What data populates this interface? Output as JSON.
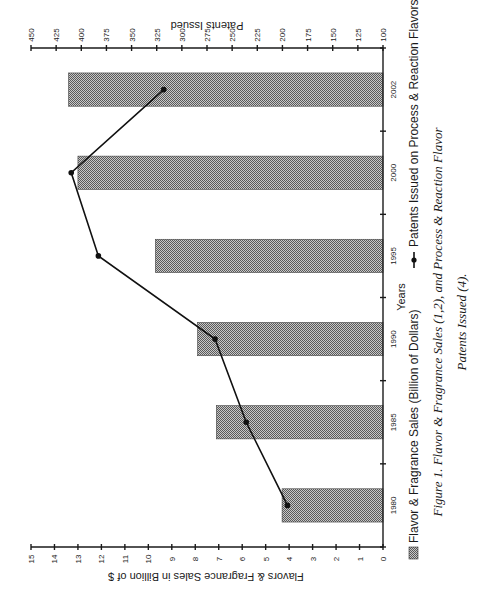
{
  "chart_data": {
    "type": "bar",
    "orientation": "rotated-90-ccw",
    "title": "",
    "caption_line1": "Figure 1. Flavor & Fragrance Sales (1,2), and Process & Reaction Flavor",
    "caption_line2": "Patents Issued (4).",
    "xlabel": "Years",
    "ylabel": "Flavors & Fragrance Sales in Billion of $",
    "y2label": "Patents Issued",
    "categories": [
      "1980",
      "1985",
      "1990",
      "1995",
      "2000",
      "2002"
    ],
    "ylim": [
      0,
      15
    ],
    "y2lim": [
      100,
      450
    ],
    "yticks": [
      0,
      1,
      2,
      3,
      4,
      5,
      6,
      7,
      8,
      9,
      10,
      11,
      12,
      13,
      14,
      15
    ],
    "y2ticks": [
      100,
      125,
      150,
      175,
      200,
      225,
      250,
      275,
      300,
      325,
      350,
      375,
      400,
      425,
      450
    ],
    "grid": false,
    "legend_position": "bottom",
    "series": [
      {
        "name": "Flavor & Fragrance Sales (Billion of Dollars)",
        "type": "bar",
        "axis": "left",
        "values": [
          4.3,
          7.1,
          7.9,
          9.7,
          13.0,
          13.4
        ]
      },
      {
        "name": "Patents Issued on Process & Reaction Flavors",
        "type": "line",
        "axis": "right",
        "values": [
          195,
          236,
          267,
          383,
          410,
          318
        ]
      }
    ]
  },
  "legend": {
    "bar_label": "Flavor & Fragrance Sales (Billion of Dollars)",
    "line_label": "Patents Issued on Process & Reaction Flavors"
  },
  "colors": {
    "bar_dark": "#5a5a5a",
    "bar_light": "#c8c8c8",
    "line": "#111111",
    "axis": "#1a1a1a"
  }
}
